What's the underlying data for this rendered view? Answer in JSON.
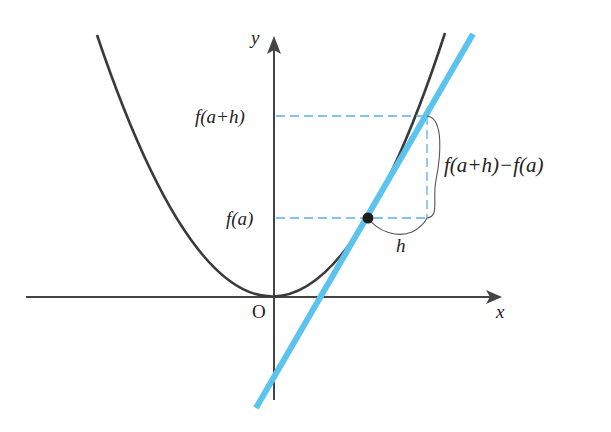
{
  "diagram": {
    "title_cutoff": "",
    "axes": {
      "x_label": "x",
      "y_label": "y",
      "origin_label": "O"
    },
    "labels": {
      "f_a": "f(a)",
      "f_a_h": "f(a+h)",
      "difference": "f(a+h)−f(a)",
      "h": "h"
    },
    "colors": {
      "curve": "#3a3a3a",
      "axis": "#444444",
      "tangent_line": "#5bc3ee",
      "dashed_guides": "#5ab0e6",
      "point": "#222222"
    },
    "elements": [
      {
        "type": "parabola",
        "description": "y = f(x) curve, vertex at origin"
      },
      {
        "type": "line",
        "description": "secant/tangent line through (a, f(a))"
      },
      {
        "type": "point",
        "description": "(a, f(a))"
      },
      {
        "type": "dashed",
        "description": "horizontal guides at f(a) and f(a+h), vertical guide at x=a+h"
      },
      {
        "type": "brace",
        "description": "brace marking vertical change f(a+h)-f(a)"
      },
      {
        "type": "brace",
        "description": "brace marking horizontal change h"
      }
    ]
  }
}
